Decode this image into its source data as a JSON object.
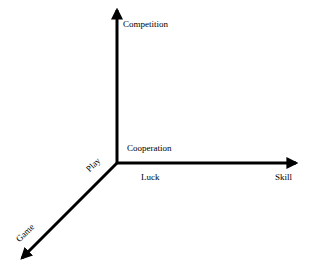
{
  "diagram": {
    "type": "3d-axes",
    "axes": [
      {
        "id": "vertical",
        "label": "Competition",
        "direction": "up"
      },
      {
        "id": "horizontal",
        "label": "Skill",
        "direction": "right"
      },
      {
        "id": "diagonal",
        "label": "Game",
        "direction": "down-left"
      }
    ],
    "labels": {
      "competition": "Competition",
      "cooperation": "Cooperation",
      "luck": "Luck",
      "skill": "Skill",
      "play": "Play",
      "game": "Game"
    },
    "colors": {
      "axis": "#000000",
      "background": "#ffffff"
    }
  }
}
